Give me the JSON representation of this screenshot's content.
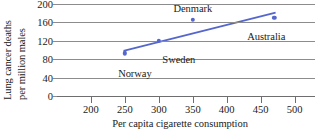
{
  "chart_data": {
    "type": "scatter",
    "title": "",
    "xlabel": "Per capita cigarette consumption",
    "ylabel_line1": "Lung cancer deaths",
    "ylabel_line2": "per million males",
    "xlim": [
      150,
      530
    ],
    "ylim": [
      0,
      200
    ],
    "xticks": [
      200,
      250,
      300,
      350,
      400,
      450,
      500
    ],
    "yticks": [
      0,
      40,
      80,
      120,
      160,
      200
    ],
    "grid": true,
    "legend": "none",
    "point_color": "#5566cc",
    "line_color": "#5566cc",
    "grid_color": "#8c8c8c",
    "points": [
      {
        "label": "Norway",
        "x": 250,
        "y": 93,
        "label_dx": 10,
        "label_dy": 22
      },
      {
        "label": "Sweden",
        "x": 300,
        "y": 120,
        "label_dx": 20,
        "label_dy": 20
      },
      {
        "label": "Denmark",
        "x": 350,
        "y": 165,
        "label_dx": 0,
        "label_dy": -10
      },
      {
        "label": "Australia",
        "x": 470,
        "y": 170,
        "label_dx": -8,
        "label_dy": 20
      }
    ],
    "trendline": {
      "x1": 248,
      "y1": 98,
      "x2": 472,
      "y2": 181
    }
  }
}
